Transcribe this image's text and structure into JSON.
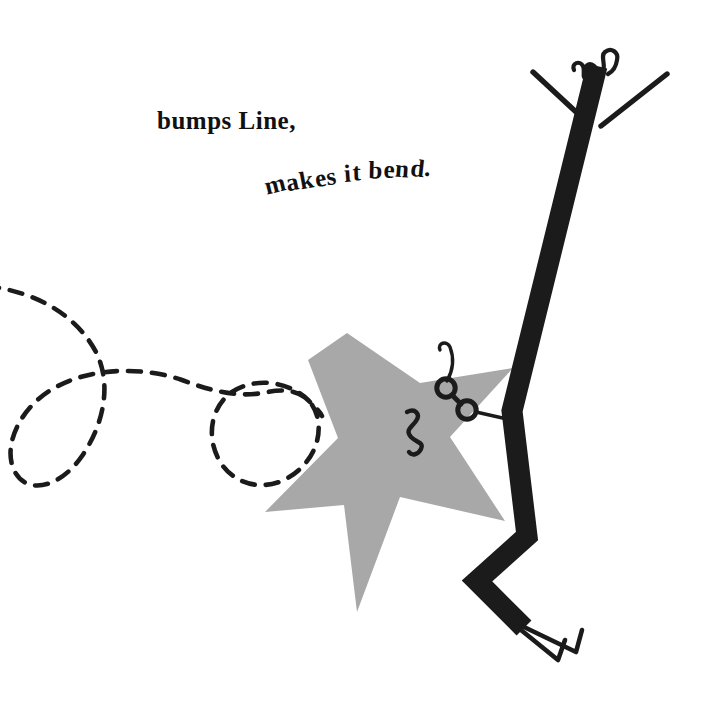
{
  "page": {
    "width": 724,
    "height": 713,
    "background_color": "#ffffff",
    "kind": "picture-book-illustration"
  },
  "caption": {
    "line_1": "bumps Line,",
    "line_2": "makes it bend.",
    "line_2_letters": [
      "m",
      "a",
      "k",
      "e",
      "s",
      " ",
      "i",
      "t",
      " ",
      "b",
      "e",
      "n",
      "d",
      "."
    ],
    "color": "#111111",
    "style": "bold-serif"
  },
  "colors": {
    "ink_black": "#1b1b1b",
    "star_gray": "#a8a8a8",
    "paper_white": "#ffffff"
  },
  "characters": {
    "line": {
      "name": "Line",
      "description": "tall thick black zigzag line figure with open mouth, curly hair, thin arms and V feet",
      "mouth_fill": "#ffffff",
      "stroke_color": "#1b1b1b"
    },
    "star": {
      "name": "Star",
      "description": "five pointed gray star with squiggle mouth and eyeglasses",
      "fill": "#a8a8a8",
      "points": 5
    },
    "squiggle": {
      "name": "dashed looping trail",
      "description": "dashed curved path with two loops entering from the left edge",
      "stroke_color": "#1b1b1b",
      "dash_pattern": "13 11"
    }
  }
}
